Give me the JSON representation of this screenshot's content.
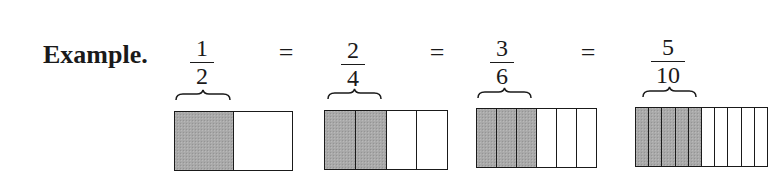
{
  "label": "Example.",
  "colors": {
    "ink": "#1a1a1a",
    "shade": "#a9a9a9",
    "background": "#ffffff"
  },
  "equals_sign": "=",
  "fractions": [
    {
      "numerator": "1",
      "denominator": "2",
      "shaded": 1,
      "parts": 2
    },
    {
      "numerator": "2",
      "denominator": "4",
      "shaded": 2,
      "parts": 4
    },
    {
      "numerator": "3",
      "denominator": "6",
      "shaded": 3,
      "parts": 6
    },
    {
      "numerator": "5",
      "denominator": "10",
      "shaded": 5,
      "parts": 10
    }
  ]
}
